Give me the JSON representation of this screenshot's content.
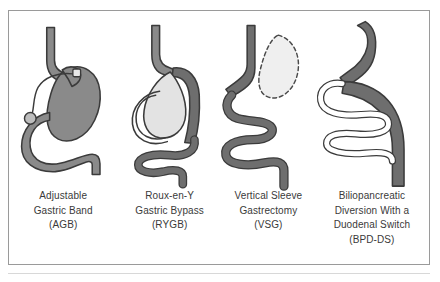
{
  "figure": {
    "background_color": "#ffffff",
    "border_color": "#9a9a9a",
    "underline_color": "#d8d8d8",
    "caption_text_color": "#3a3a3a",
    "palette": {
      "stomach_fill_dark": "#8a8a8a",
      "pouch_fill_light": "#e3e3e3",
      "tube_fill": "#6e6e6e",
      "tube_fill_light": "#ffffff",
      "outline": "#3b3b3b",
      "dashed_outline": "#4a4a4a",
      "remnant_fill": "#efefef"
    },
    "panels": [
      {
        "id": "agb",
        "name": "adjustable-gastric-band",
        "caption_lines": [
          "Adjustable",
          "Gastric Band",
          "(AGB)"
        ],
        "parts": [
          "esophagus",
          "banded-stomach",
          "gastric-band",
          "connecting-tube",
          "access-port",
          "duodenum"
        ]
      },
      {
        "id": "rygb",
        "name": "roux-en-y-gastric-bypass",
        "caption_lines": [
          "Roux-en-Y",
          "Gastric Bypass",
          "(RYGB)"
        ],
        "parts": [
          "esophagus",
          "gastric-pouch",
          "bypassed-stomach",
          "roux-limb",
          "jejunum"
        ]
      },
      {
        "id": "vsg",
        "name": "vertical-sleeve-gastrectomy",
        "caption_lines": [
          "Vertical Sleeve",
          "Gastrectomy",
          "(VSG)"
        ],
        "parts": [
          "esophagus",
          "gastric-sleeve",
          "resected-stomach-outline",
          "intestine"
        ]
      },
      {
        "id": "bpdds",
        "name": "biliopancreatic-diversion-with-duodenal-switch",
        "caption_lines": [
          "Biliopancreatic",
          "Diversion With a",
          "Duodenal Switch",
          "(BPD-DS)"
        ],
        "parts": [
          "esophagus",
          "gastric-sleeve",
          "duodenal-switch-limb",
          "common-channel",
          "intestine"
        ]
      }
    ]
  }
}
